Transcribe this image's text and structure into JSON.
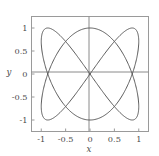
{
  "chart_data": {
    "type": "line",
    "title": "",
    "subtitle": "",
    "xlabel": "x",
    "ylabel": "y",
    "xlim": [
      -1.2,
      1.2
    ],
    "ylim": [
      -1.25,
      1.25
    ],
    "xticks": [
      -1,
      -0.5,
      0,
      0.5,
      1
    ],
    "xtick_labels": [
      "-1",
      "-0.5",
      "0",
      "0.5",
      "1"
    ],
    "yticks": [
      1,
      0.5,
      0,
      -0.5,
      -1
    ],
    "ytick_labels": [
      "1",
      "0.5",
      "0",
      "-0.5",
      "-1"
    ],
    "grid": false,
    "legend": null,
    "legend_position": "none",
    "frame": true,
    "axis_lines_through_origin": true,
    "series": [
      {
        "name": "curve",
        "color": "#5a5a5a",
        "line_width": 1.0,
        "closed": true,
        "parametric": {
          "x_expr": "sin(2t)",
          "y_expr": "sin(3t)",
          "t_range": [
            0,
            6.283185307179586
          ],
          "samples": 720
        },
        "x": [
          0.0,
          0.309,
          0.5878,
          0.809,
          0.9511,
          1.0,
          0.9511,
          0.809,
          0.5878,
          0.309,
          0.0,
          -0.309,
          -0.5878,
          -0.809,
          -0.9511,
          -1.0,
          -0.9511,
          -0.809,
          -0.5878,
          -0.309,
          0.0,
          0.309,
          0.5878,
          0.809,
          0.9511,
          1.0,
          0.9511,
          0.809,
          0.5878,
          0.309,
          0.0,
          -0.309,
          -0.5878,
          -0.809,
          -0.9511,
          -1.0,
          -0.9511,
          -0.809,
          -0.5878,
          -0.309,
          0.0
        ],
        "y": [
          0.0,
          0.454,
          0.809,
          0.9877,
          0.9511,
          0.7071,
          0.309,
          -0.1564,
          -0.5878,
          -0.891,
          -1.0,
          -0.891,
          -0.5878,
          -0.1564,
          0.309,
          0.7071,
          0.9511,
          0.9877,
          0.809,
          0.454,
          0.0,
          -0.454,
          -0.809,
          -0.9877,
          -0.9511,
          -0.7071,
          -0.309,
          0.1564,
          0.5878,
          0.891,
          1.0,
          0.891,
          0.5878,
          0.1564,
          -0.309,
          -0.7071,
          -0.9511,
          -0.9877,
          -0.809,
          -0.454,
          0.0
        ],
        "lobe_extremes": {
          "left_lobe_peak": [
            -0.68,
            1.0
          ],
          "left_lobe_trough": [
            -0.68,
            -1.0
          ],
          "right_lobe_peak": [
            0.68,
            1.0
          ],
          "right_lobe_trough": [
            0.68,
            -1.0
          ],
          "left_extent": -1.0,
          "right_extent": 1.0,
          "crossing_point": [
            0,
            0
          ]
        }
      }
    ],
    "colors": {
      "curve": "#5a5a5a",
      "frame": "#9a9a9a",
      "axis": "#8a8a8a",
      "tick_text": "#4a4a4a",
      "background": "#ffffff"
    }
  }
}
